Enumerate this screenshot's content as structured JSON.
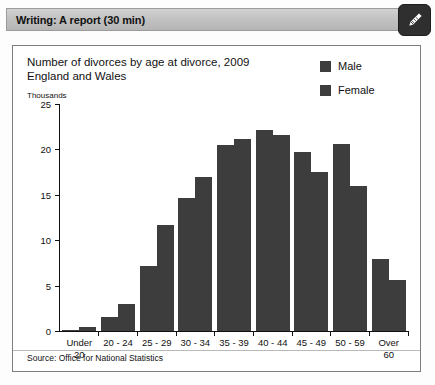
{
  "header": {
    "title": "Writing: A report (30 min)",
    "badge_icon": "pencil-icon"
  },
  "chart_data": {
    "type": "bar",
    "title": "Number of divorces by age at divorce, 2009\nEngland and Wales",
    "title_line1": "Number of divorces by age at divorce, 2009",
    "title_line2": "England and Wales",
    "units_label": "Thousands",
    "xlabel": "",
    "ylabel": "Thousands",
    "ylim": [
      0,
      25
    ],
    "yticks": [
      25,
      20,
      15,
      10,
      5,
      0
    ],
    "grid": false,
    "legend_position": "top-right",
    "categories": [
      "Under\n20",
      "20 - 24",
      "25 - 29",
      "30 - 34",
      "35 - 39",
      "40 - 44",
      "45 - 49",
      "50 - 59",
      "Over\n60"
    ],
    "series": [
      {
        "name": "Male",
        "color": "#3d3d3d",
        "values": [
          0.1,
          1.5,
          7.2,
          14.6,
          20.5,
          22.1,
          19.7,
          20.6,
          7.9
        ]
      },
      {
        "name": "Female",
        "color": "#3d3d3d",
        "values": [
          0.4,
          3.0,
          11.7,
          17.0,
          21.1,
          21.6,
          17.5,
          16.0,
          5.6
        ]
      }
    ],
    "source": "Source: Office for National Statistics"
  },
  "colors": {
    "bar": "#3d3d3d",
    "header_bar": "#c2c2c2",
    "frame_border": "#7d7d7d",
    "badge": "#2f2f2f"
  }
}
